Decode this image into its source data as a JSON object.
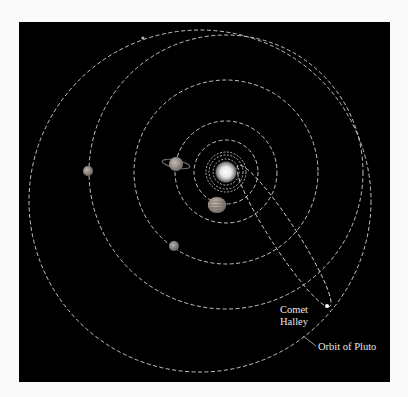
{
  "diagram": {
    "background": "#000000",
    "page_background": "#fafafa",
    "orbit_color": "#d8d8d8",
    "frame": {
      "x": 19,
      "y": 22,
      "width": 371,
      "height": 360
    },
    "sun": {
      "name": "Sun",
      "cx": 226,
      "cy": 172,
      "r": 12
    },
    "orbits": [
      {
        "name": "Mercury orbit",
        "cx": 226,
        "cy": 172,
        "r": 9
      },
      {
        "name": "Venus orbit",
        "cx": 226,
        "cy": 172,
        "r": 13
      },
      {
        "name": "Earth orbit",
        "cx": 226,
        "cy": 172,
        "r": 17
      },
      {
        "name": "Mars orbit",
        "cx": 226,
        "cy": 172,
        "r": 20
      },
      {
        "name": "Jupiter orbit",
        "cx": 226,
        "cy": 172,
        "r": 32
      },
      {
        "name": "Saturn orbit",
        "cx": 226,
        "cy": 172,
        "r": 51
      },
      {
        "name": "Uranus orbit",
        "cx": 226,
        "cy": 172,
        "r": 92
      },
      {
        "name": "Neptune orbit",
        "cx": 226,
        "cy": 172,
        "r": 137
      },
      {
        "name": "Pluto orbit",
        "cx": 200,
        "cy": 201,
        "r": 171
      }
    ],
    "planets": [
      {
        "name": "Jupiter",
        "cx": 217,
        "cy": 205,
        "r": 8,
        "color": "#a89a90",
        "banded": true
      },
      {
        "name": "Saturn",
        "cx": 176,
        "cy": 164,
        "r": 7,
        "color": "#a49a92",
        "ringed": true
      },
      {
        "name": "Uranus",
        "cx": 88,
        "cy": 171,
        "r": 5,
        "color": "#9a8e86"
      },
      {
        "name": "Neptune",
        "cx": 174,
        "cy": 246,
        "r": 5,
        "color": "#8e8882"
      },
      {
        "name": "Pluto",
        "cx": 143,
        "cy": 38,
        "r": 1.6,
        "color": "#bdbdbd"
      }
    ],
    "comet": {
      "name": "Comet Halley",
      "orbit": {
        "cx": 284,
        "cy": 236,
        "rx": 84,
        "ry": 13,
        "rotate": 57
      },
      "position": {
        "cx": 327,
        "cy": 306
      }
    },
    "labels": {
      "comet_line1": "Comet",
      "comet_line2": "Halley",
      "pluto_orbit": "Orbit of Pluto"
    }
  }
}
